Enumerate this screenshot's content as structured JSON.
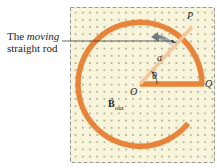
{
  "caption": {
    "line1_prefix": "The ",
    "line1_italic": "moving",
    "line2": "straight rod"
  },
  "labels": {
    "P": "P",
    "Q": "Q",
    "O": "O",
    "a": "a",
    "theta": "θ",
    "B_main": "B",
    "B_sub": "out"
  },
  "colors": {
    "field_bg": "#f8f4dc",
    "field_dot": "#8a9a6a",
    "border": "#999999",
    "conductor": "#e8843a",
    "rod": "#f4c79a",
    "arrow": "#9aa3ab"
  }
}
